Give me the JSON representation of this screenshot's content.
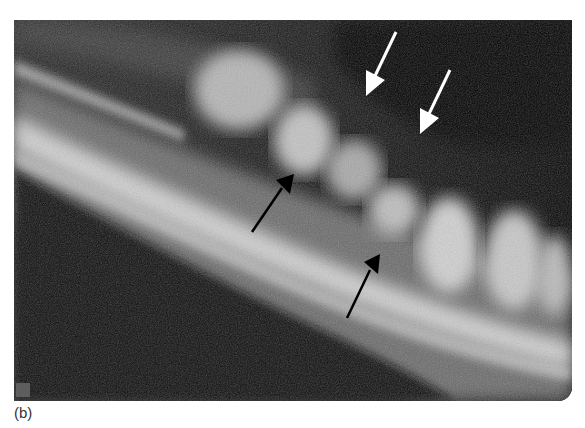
{
  "figure": {
    "label": "(b)",
    "annotations": [
      {
        "type": "arrow",
        "color": "#ffffff",
        "from": [
          396,
          32
        ],
        "to": [
          368,
          96
        ],
        "name": "white-arrow-1"
      },
      {
        "type": "arrow",
        "color": "#ffffff",
        "from": [
          452,
          70
        ],
        "to": [
          424,
          134
        ],
        "name": "white-arrow-2"
      },
      {
        "type": "arrow",
        "color": "#000000",
        "from": [
          252,
          232
        ],
        "to": [
          292,
          176
        ],
        "name": "black-arrow-1"
      },
      {
        "type": "arrow",
        "color": "#000000",
        "from": [
          348,
          318
        ],
        "to": [
          378,
          255
        ],
        "name": "black-arrow-2"
      }
    ],
    "colors": {
      "background": "#111111",
      "bone": "#c8c8c8",
      "tooth": "#d6d6d6"
    }
  }
}
